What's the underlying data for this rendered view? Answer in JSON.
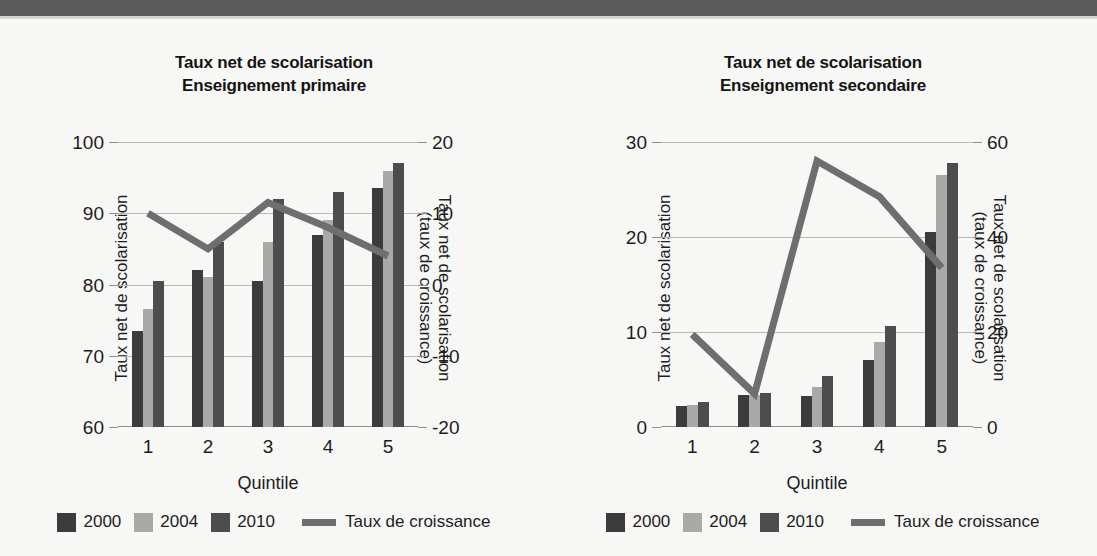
{
  "figure": {
    "background": "#f7f7f5",
    "banner_color": "#5c5c5c"
  },
  "series_colors": {
    "y2000": "#3c3c3c",
    "y2004": "#a9a9a7",
    "y2010": "#4d4d4d",
    "growth_line": "#6e6e6e"
  },
  "legend": {
    "items": [
      {
        "label": "2000",
        "swatch": "#3c3c3c",
        "type": "bar"
      },
      {
        "label": "2004",
        "swatch": "#a9a9a7",
        "type": "bar"
      },
      {
        "label": "2010",
        "swatch": "#4d4d4d",
        "type": "bar"
      },
      {
        "label": "Taux de croissance",
        "swatch": "#6e6e6e",
        "type": "line"
      }
    ]
  },
  "panels": {
    "primary": {
      "title_line1": "Taux net de scolarisation",
      "title_line2": "Enseignement primaire",
      "xlabel": "Quintile",
      "ylabel_left": "Taux net de scolarisation",
      "ylabel_right_line1": "Taux net de scolarisation",
      "ylabel_right_line2": "(taux de croissance)",
      "yticks_left": [
        "100",
        "90",
        "80",
        "70",
        "60"
      ],
      "yticks_right": [
        "20",
        "10",
        "0",
        "-10",
        "-20"
      ],
      "xticks": [
        "1",
        "2",
        "3",
        "4",
        "5"
      ]
    },
    "secondary": {
      "title_line1": "Taux net de scolarisation",
      "title_line2": "Enseignement secondaire",
      "xlabel": "Quintile",
      "ylabel_left": "Taux net de scolarisation",
      "ylabel_right_line1": "Taux net de scolarisation",
      "ylabel_right_line2": "(taux de croissance)",
      "yticks_left": [
        "30",
        "20",
        "10",
        "0"
      ],
      "yticks_right": [
        "60",
        "40",
        "20",
        "0"
      ],
      "xticks": [
        "1",
        "2",
        "3",
        "4",
        "5"
      ]
    }
  },
  "chart_data": [
    {
      "type": "bar",
      "id": "primary",
      "title": "Taux net de scolarisation - Enseignement primaire",
      "xlabel": "Quintile",
      "ylabel": "Taux net de scolarisation",
      "ylabel_secondary": "Taux net de scolarisation (taux de croissance)",
      "categories": [
        "1",
        "2",
        "3",
        "4",
        "5"
      ],
      "ylim": [
        60,
        100
      ],
      "yticks": [
        60,
        70,
        80,
        90,
        100
      ],
      "ylim_secondary": [
        -20,
        20
      ],
      "yticks_secondary": [
        -20,
        -10,
        0,
        10,
        20
      ],
      "grid": true,
      "legend_position": "bottom",
      "series": [
        {
          "name": "2000",
          "type": "bar",
          "axis": "left",
          "color": "#3c3c3c",
          "values": [
            73.5,
            82.0,
            80.5,
            87.0,
            93.5
          ]
        },
        {
          "name": "2004",
          "type": "bar",
          "axis": "left",
          "color": "#a9a9a7",
          "values": [
            76.5,
            81.0,
            86.0,
            89.0,
            96.0
          ]
        },
        {
          "name": "2010",
          "type": "bar",
          "axis": "left",
          "color": "#4d4d4d",
          "values": [
            80.5,
            86.0,
            92.0,
            93.0,
            97.0
          ]
        },
        {
          "name": "Taux de croissance",
          "type": "line",
          "axis": "right",
          "color": "#6e6e6e",
          "values": [
            10.0,
            5.0,
            11.5,
            8.0,
            4.0
          ]
        }
      ]
    },
    {
      "type": "bar",
      "id": "secondary",
      "title": "Taux net de scolarisation - Enseignement secondaire",
      "xlabel": "Quintile",
      "ylabel": "Taux net de scolarisation",
      "ylabel_secondary": "Taux net de scolarisation (taux de croissance)",
      "categories": [
        "1",
        "2",
        "3",
        "4",
        "5"
      ],
      "ylim": [
        0,
        30
      ],
      "yticks": [
        0,
        10,
        20,
        30
      ],
      "ylim_secondary": [
        0,
        60
      ],
      "yticks_secondary": [
        0,
        20,
        40,
        60
      ],
      "grid": true,
      "legend_position": "bottom",
      "series": [
        {
          "name": "2000",
          "type": "bar",
          "axis": "left",
          "color": "#3c3c3c",
          "values": [
            2.2,
            3.4,
            3.3,
            7.1,
            20.5
          ]
        },
        {
          "name": "2004",
          "type": "bar",
          "axis": "left",
          "color": "#a9a9a7",
          "values": [
            2.3,
            3.4,
            4.2,
            9.0,
            26.5
          ]
        },
        {
          "name": "2010",
          "type": "bar",
          "axis": "left",
          "color": "#4d4d4d",
          "values": [
            2.6,
            3.6,
            5.4,
            10.6,
            27.8
          ]
        },
        {
          "name": "Taux de croissance",
          "type": "line",
          "axis": "right",
          "color": "#6e6e6e",
          "values": [
            19.5,
            7.0,
            56.0,
            48.5,
            33.5
          ]
        }
      ]
    }
  ]
}
